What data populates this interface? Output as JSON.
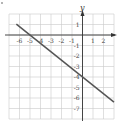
{
  "chart_data": {
    "type": "line",
    "title": "",
    "xlabel": "",
    "ylabel": "y",
    "xlim": [
      -7,
      3
    ],
    "ylim": [
      -8,
      2
    ],
    "grid": true,
    "x_ticks": [
      -6,
      -5,
      -4,
      -3,
      -2,
      -1,
      1,
      2
    ],
    "x_tick_labels": [
      "-6",
      "-5",
      "-4",
      "-3",
      "-2",
      "-1",
      "1",
      "2"
    ],
    "y_ticks": [
      1,
      -1,
      -2,
      -3,
      -4,
      -5,
      -6,
      -7
    ],
    "y_tick_labels": [
      "1",
      "-1",
      "-2",
      "-3",
      "-4",
      "-5",
      "-6",
      "-7"
    ],
    "series": [
      {
        "name": "line",
        "equation": "y = -4/5 x - 4",
        "x": [
          -6.3,
          3
        ],
        "y": [
          1.04,
          -6.4
        ],
        "color": "#555555"
      }
    ],
    "legend": "none"
  },
  "colors": {
    "grid": "#c9c9c9",
    "axis": "#333333",
    "line": "#555555"
  }
}
